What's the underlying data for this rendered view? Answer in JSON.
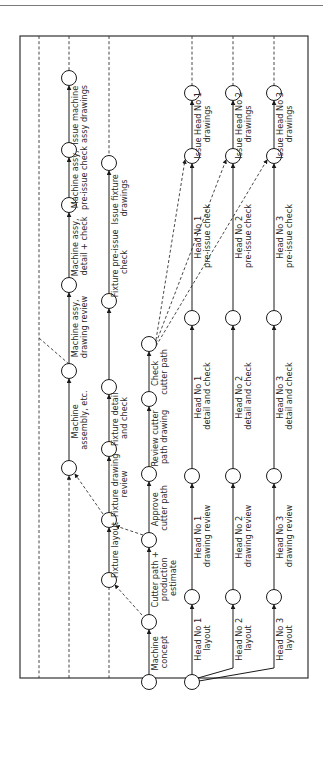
{
  "header": {
    "text": "…project applications"
  },
  "diagram": {
    "type": "activity-network",
    "orientation": "rotated-90-ccw",
    "colors": {
      "line": "#1a1a1a",
      "node_fill": "#ffffff",
      "frame": "#333333"
    },
    "lanes": [
      {
        "id": "outer-left",
        "x": 39,
        "dashed_only": true
      },
      {
        "id": "machine-assy",
        "x": 69
      },
      {
        "id": "fixture",
        "x": 109
      },
      {
        "id": "cutter-path",
        "x": 149
      },
      {
        "id": "head-1",
        "x": 192
      },
      {
        "id": "head-2",
        "x": 233
      },
      {
        "id": "head-3",
        "x": 274
      }
    ],
    "nodes": [
      {
        "id": "n-start-machine",
        "lane": "cutter-path",
        "y": 682
      },
      {
        "id": "n-machine-concept",
        "lane": "cutter-path",
        "y": 622
      },
      {
        "id": "n-cutter-estimate",
        "lane": "cutter-path",
        "y": 540
      },
      {
        "id": "n-approve-cutter",
        "lane": "cutter-path",
        "y": 474
      },
      {
        "id": "n-review-cutter",
        "lane": "cutter-path",
        "y": 399
      },
      {
        "id": "n-check-cutter",
        "lane": "cutter-path",
        "y": 344
      },
      {
        "id": "n-fixture-layout-start",
        "lane": "fixture",
        "y": 580
      },
      {
        "id": "n-fixture-layout-end",
        "lane": "fixture",
        "y": 520
      },
      {
        "id": "n-fixture-drawing-review",
        "lane": "fixture",
        "y": 449
      },
      {
        "id": "n-fixture-detail",
        "lane": "fixture",
        "y": 387
      },
      {
        "id": "n-fixture-preissue",
        "lane": "fixture",
        "y": 301
      },
      {
        "id": "n-fixture-issue",
        "lane": "fixture",
        "y": 163
      },
      {
        "id": "n-machine-assembly",
        "lane": "machine-assy",
        "y": 468
      },
      {
        "id": "n-machine-drawing-review",
        "lane": "machine-assy",
        "y": 371
      },
      {
        "id": "n-machine-detail",
        "lane": "machine-assy",
        "y": 285
      },
      {
        "id": "n-machine-preissue",
        "lane": "machine-assy",
        "y": 205
      },
      {
        "id": "n-machine-issue",
        "lane": "machine-assy",
        "y": 150
      },
      {
        "id": "n-machine-end",
        "lane": "machine-assy",
        "y": 78
      },
      {
        "id": "n-head-start",
        "lane": "head-1",
        "y": 682
      },
      {
        "id": "n-head1-layout",
        "lane": "head-1",
        "y": 597
      },
      {
        "id": "n-head1-review",
        "lane": "head-1",
        "y": 476
      },
      {
        "id": "n-head1-detail",
        "lane": "head-1",
        "y": 318
      },
      {
        "id": "n-head1-preissue",
        "lane": "head-1",
        "y": 156
      },
      {
        "id": "n-head1-issue",
        "lane": "head-1",
        "y": 93
      },
      {
        "id": "n-head2-layout",
        "lane": "head-2",
        "y": 597
      },
      {
        "id": "n-head2-review",
        "lane": "head-2",
        "y": 476
      },
      {
        "id": "n-head2-detail",
        "lane": "head-2",
        "y": 318
      },
      {
        "id": "n-head2-preissue",
        "lane": "head-2",
        "y": 156
      },
      {
        "id": "n-head2-issue",
        "lane": "head-2",
        "y": 93
      },
      {
        "id": "n-head3-layout",
        "lane": "head-3",
        "y": 597
      },
      {
        "id": "n-head3-review",
        "lane": "head-3",
        "y": 476
      },
      {
        "id": "n-head3-detail",
        "lane": "head-3",
        "y": 318
      },
      {
        "id": "n-head3-preissue",
        "lane": "head-3",
        "y": 156
      },
      {
        "id": "n-head3-issue",
        "lane": "head-3",
        "y": 93
      }
    ],
    "activities": [
      {
        "label_lines": [
          "Machine",
          "concept"
        ]
      },
      {
        "label_lines": [
          "Cutter path +",
          "production",
          "estimate"
        ]
      },
      {
        "label_lines": [
          "Approve",
          "cutter path"
        ]
      },
      {
        "label_lines": [
          "Review cutter",
          "path drawing"
        ]
      },
      {
        "label_lines": [
          "Check",
          "cutter path"
        ]
      },
      {
        "label_lines": [
          "Fixture layout"
        ]
      },
      {
        "label_lines": [
          "Fixture drawing",
          "review"
        ]
      },
      {
        "label_lines": [
          "Fixture detail",
          "and check"
        ]
      },
      {
        "label_lines": [
          "Fixture pre-issue",
          "check"
        ]
      },
      {
        "label_lines": [
          "Issue fixture",
          "drawings"
        ]
      },
      {
        "label_lines": [
          "Machine",
          "assembly, etc."
        ]
      },
      {
        "label_lines": [
          "Machine assy,",
          "drawing review"
        ]
      },
      {
        "label_lines": [
          "Machine assy,",
          "detail + check"
        ]
      },
      {
        "label_lines": [
          "Machine assy,",
          "pre-issue check"
        ]
      },
      {
        "label_lines": [
          "Issue machine",
          "assy drawings"
        ]
      },
      {
        "label_lines": [
          "Head No 1",
          "layout"
        ]
      },
      {
        "label_lines": [
          "Head No 1",
          "drawing review"
        ]
      },
      {
        "label_lines": [
          "Head No 1",
          "detail and check"
        ]
      },
      {
        "label_lines": [
          "Head No 1",
          "pre-issue check"
        ]
      },
      {
        "label_lines": [
          "Issue Head No 1",
          "drawings"
        ]
      },
      {
        "label_lines": [
          "Head No 2",
          "layout"
        ]
      },
      {
        "label_lines": [
          "Head No 2",
          "drawing review"
        ]
      },
      {
        "label_lines": [
          "Head No 2",
          "detail and check"
        ]
      },
      {
        "label_lines": [
          "Head No 2",
          "pre-issue check"
        ]
      },
      {
        "label_lines": [
          "Issue Head No 2",
          "drawings"
        ]
      },
      {
        "label_lines": [
          "Head No 3",
          "layout"
        ]
      },
      {
        "label_lines": [
          "Head No 3",
          "drawing review"
        ]
      },
      {
        "label_lines": [
          "Head No 3",
          "detail and check"
        ]
      },
      {
        "label_lines": [
          "Head No 3",
          "pre-issue check"
        ]
      },
      {
        "label_lines": [
          "Issue Head No 3",
          "drawings"
        ]
      }
    ],
    "labels": {
      "machine_concept": [
        "Machine",
        "concept"
      ],
      "cutter_estimate": [
        "Cutter path +",
        "production",
        "estimate"
      ],
      "approve_cutter": [
        "Approve",
        "cutter path"
      ],
      "review_cutter": [
        "Review cutter",
        "path drawing"
      ],
      "check_cutter": [
        "Check",
        "cutter path"
      ],
      "fixture_layout": [
        "Fixture layout"
      ],
      "fixture_review": [
        "Fixture drawing",
        "review"
      ],
      "fixture_detail": [
        "Fixture detail",
        "and check"
      ],
      "fixture_preissue": [
        "Fixture pre-issue",
        "check"
      ],
      "fixture_issue": [
        "Issue fixture",
        "drawings"
      ],
      "machine_assembly": [
        "Machine",
        "assembly, etc."
      ],
      "machine_review": [
        "Machine assy,",
        "drawing review"
      ],
      "machine_detail": [
        "Machine assy,",
        "detail + check"
      ],
      "machine_preissue": [
        "Machine assy,",
        "pre-issue check"
      ],
      "machine_issue": [
        "Issue machine",
        "assy drawings"
      ],
      "head1_layout": [
        "Head No 1",
        "layout"
      ],
      "head1_review": [
        "Head No 1",
        "drawing review"
      ],
      "head1_detail": [
        "Head No 1",
        "detail and check"
      ],
      "head1_preissue": [
        "Head No 1",
        "pre-issue check"
      ],
      "head1_issue": [
        "Issue Head No 1",
        "drawings"
      ],
      "head2_layout": [
        "Head No 2",
        "layout"
      ],
      "head2_review": [
        "Head No 2",
        "drawing review"
      ],
      "head2_detail": [
        "Head No 2",
        "detail and check"
      ],
      "head2_preissue": [
        "Head No 2",
        "pre-issue check"
      ],
      "head2_issue": [
        "Issue Head No 2",
        "drawings"
      ],
      "head3_layout": [
        "Head No 3",
        "layout"
      ],
      "head3_review": [
        "Head No 3",
        "drawing review"
      ],
      "head3_detail": [
        "Head No 3",
        "detail and check"
      ],
      "head3_preissue": [
        "Head No 3",
        "pre-issue check"
      ],
      "head3_issue": [
        "Issue Head No 3",
        "drawings"
      ]
    }
  }
}
